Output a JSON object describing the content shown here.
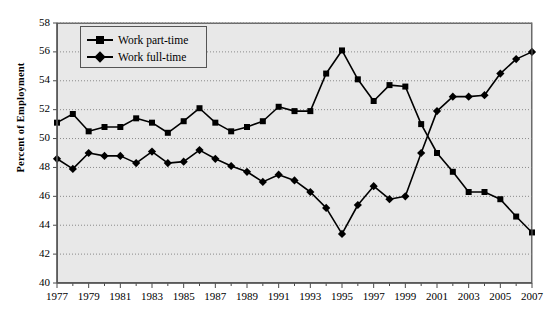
{
  "chart_data": {
    "type": "line",
    "title": "",
    "xlabel": "",
    "ylabel": "Percent of Employment",
    "xlim": [
      1977,
      2007
    ],
    "ylim": [
      40,
      58
    ],
    "ytick_step": 2,
    "xtick_step": 2,
    "grid": true,
    "legend_position": "top-left",
    "plot_background": "#e8e8e8",
    "line_color": "#000000",
    "x": [
      1977,
      1978,
      1979,
      1980,
      1981,
      1982,
      1983,
      1984,
      1985,
      1986,
      1987,
      1988,
      1989,
      1990,
      1991,
      1992,
      1993,
      1994,
      1995,
      1996,
      1997,
      1998,
      1999,
      2000,
      2001,
      2002,
      2003,
      2004,
      2005,
      2006,
      2007
    ],
    "yticks": [
      40,
      42,
      44,
      46,
      48,
      50,
      52,
      54,
      56,
      58
    ],
    "xticks_labeled": [
      1977,
      1979,
      1981,
      1983,
      1985,
      1987,
      1989,
      1991,
      1993,
      1995,
      1997,
      1999,
      2001,
      2003,
      2005,
      2007
    ],
    "series": [
      {
        "name": "Work part-time",
        "marker": "square",
        "values": [
          51.1,
          51.7,
          50.5,
          50.8,
          50.8,
          51.4,
          51.1,
          50.4,
          51.2,
          52.1,
          51.1,
          50.5,
          50.8,
          51.2,
          52.2,
          51.9,
          51.9,
          54.5,
          56.1,
          54.1,
          52.6,
          53.7,
          53.6,
          51.0,
          49.0,
          47.7,
          46.3,
          46.3,
          45.8,
          44.6,
          43.5
        ]
      },
      {
        "name": "Work full-time",
        "marker": "diamond",
        "values": [
          48.6,
          47.9,
          49.0,
          48.8,
          48.8,
          48.3,
          49.1,
          48.3,
          48.4,
          49.2,
          48.6,
          48.1,
          47.7,
          47.0,
          47.5,
          47.1,
          46.3,
          45.2,
          43.4,
          45.4,
          46.7,
          45.8,
          46.0,
          49.0,
          51.9,
          52.9,
          52.9,
          53.0,
          54.5,
          55.5,
          56.0
        ]
      }
    ],
    "legend": [
      {
        "label": "Work part-time",
        "marker": "square"
      },
      {
        "label": "Work full-time",
        "marker": "diamond"
      }
    ]
  }
}
